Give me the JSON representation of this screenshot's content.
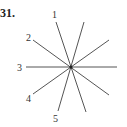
{
  "problem_number": "31.",
  "lines": [
    {
      "label": "1"
    },
    {
      "label": "2"
    },
    {
      "label": "3"
    },
    {
      "label": "4"
    },
    {
      "label": "5"
    }
  ],
  "colors": {
    "line": "#555555",
    "text": "#333333"
  }
}
